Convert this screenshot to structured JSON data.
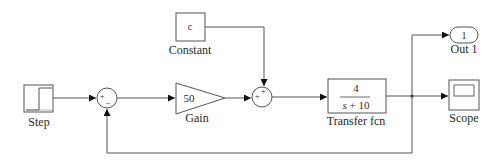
{
  "diagram": {
    "type": "simulink-block-diagram",
    "line_color": "#555555",
    "blocks": {
      "step": {
        "label": "Step"
      },
      "sum1": {
        "signs": [
          "+",
          "–"
        ]
      },
      "gain": {
        "value": "50",
        "label": "Gain"
      },
      "constant": {
        "value": "c",
        "label": "Constant"
      },
      "sum2": {
        "signs": [
          "+",
          "+"
        ]
      },
      "transfer_fcn": {
        "numerator": "4",
        "denominator_var": "s",
        "denominator_rest": " + 10",
        "label": "Transfer fcn"
      },
      "out1": {
        "value": "1",
        "label": "Out 1"
      },
      "scope": {
        "label": "Scope"
      }
    },
    "connections": [
      "Step -> Sum1(+)",
      "Sum1 -> Gain",
      "Gain -> Sum2(+)",
      "Constant -> Sum2(+)",
      "Sum2 -> Transfer fcn",
      "Transfer fcn -> Out 1",
      "Transfer fcn -> Scope",
      "Transfer fcn -> Sum1(-) feedback"
    ]
  }
}
